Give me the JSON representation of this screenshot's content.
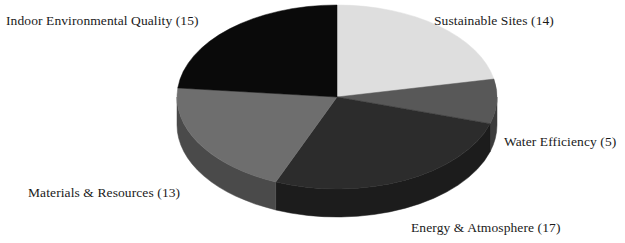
{
  "chart_data": {
    "type": "pie",
    "title": "",
    "subtitle": "",
    "xlabel": "",
    "ylabel": "",
    "legend_position": "none",
    "grid": false,
    "labels_outside": true,
    "three_d": true,
    "total": 64,
    "categories": [
      "Sustainable Sites",
      "Water Efficiency",
      "Energy & Atmosphere",
      "Materials & Resources",
      "Indoor Environmental Quality"
    ],
    "values": [
      14,
      5,
      17,
      13,
      15
    ],
    "colors": [
      "#dedede",
      "#585858",
      "#2c2c2c",
      "#6e6e6e",
      "#0a0a0a"
    ],
    "slices": [
      {
        "name": "sustainable-sites",
        "label": "Sustainable Sites (14)",
        "category": "Sustainable Sites",
        "value": 14,
        "percent": 21.9,
        "color": "#dedede",
        "side_color": "#b4b4b4",
        "start_angle": 0,
        "end_angle": 78.75
      },
      {
        "name": "water-efficiency",
        "label": "Water Efficiency (5)",
        "category": "Water Efficiency",
        "value": 5,
        "percent": 7.8,
        "color": "#585858",
        "side_color": "#3c3c3c",
        "start_angle": 78.75,
        "end_angle": 106.88
      },
      {
        "name": "energy-atmosphere",
        "label": "Energy & Atmosphere (17)",
        "category": "Energy & Atmosphere",
        "value": 17,
        "percent": 26.6,
        "color": "#2c2c2c",
        "side_color": "#1c1c1c",
        "start_angle": 106.88,
        "end_angle": 202.5
      },
      {
        "name": "materials-resources",
        "label": "Materials & Resources (13)",
        "category": "Materials & Resources",
        "value": 13,
        "percent": 20.3,
        "color": "#6e6e6e",
        "side_color": "#4a4a4a",
        "start_angle": 202.5,
        "end_angle": 275.63
      },
      {
        "name": "indoor-environmental-quality",
        "label": "Indoor Environmental Quality (15)",
        "category": "Indoor Environmental Quality",
        "value": 15,
        "percent": 23.4,
        "color": "#0a0a0a",
        "side_color": "#000000",
        "start_angle": 275.63,
        "end_angle": 360
      }
    ],
    "geometry": {
      "cx": 337,
      "cy": 97,
      "rx": 160,
      "ry": 92,
      "depth": 28
    }
  },
  "labels": {
    "indoor_environmental_quality": "Indoor Environmental Quality (15)",
    "sustainable_sites": "Sustainable Sites (14)",
    "water_efficiency": "Water Efficiency (5)",
    "energy_atmosphere": "Energy & Atmosphere (17)",
    "materials_resources": "Materials & Resources (13)"
  },
  "background_color": "#ffffff",
  "text_color": "#1a1a1a"
}
